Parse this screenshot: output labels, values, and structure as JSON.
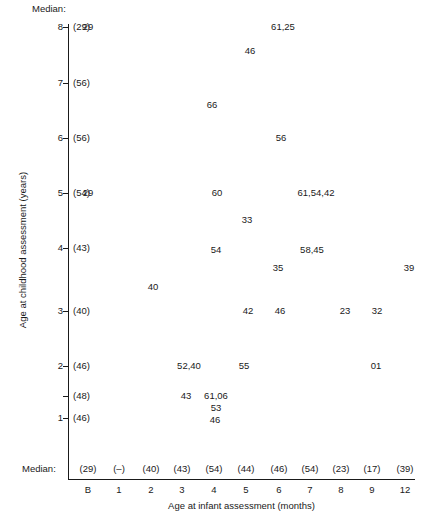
{
  "chart_data": {
    "type": "scatter",
    "title": "",
    "xlabel": "Age at infant assessment (months)",
    "ylabel": "Age at childhood assessment (years)",
    "grid": false,
    "legend": null,
    "notation": "Each plotted entry is a text label listing subject value(s) at that (infant age, childhood age) coordinate; comma-separated when several overlap.",
    "x_categories": [
      "B",
      "1",
      "2",
      "3",
      "4",
      "5",
      "6",
      "7",
      "8",
      "9",
      "12"
    ],
    "x_positions_px": [
      88,
      119,
      151,
      182,
      214,
      246,
      279,
      310,
      341,
      372,
      405
    ],
    "y_ticks": [
      8,
      7,
      6,
      5,
      4,
      3,
      2,
      1
    ],
    "y_tick_positions_px": [
      27,
      83,
      138,
      193,
      248,
      311,
      366,
      418
    ],
    "y_extra_tick_label": "",
    "y_extra_tick_position_px": 396,
    "ylim": [
      0.6,
      8.4
    ],
    "median_row_header": "Median:",
    "y_medians": [
      {
        "y": 8,
        "label": "(29)"
      },
      {
        "y": 7,
        "label": "(56)"
      },
      {
        "y": 6,
        "label": "(56)"
      },
      {
        "y": 5,
        "label": "(54)"
      },
      {
        "y": 4,
        "label": "(43)"
      },
      {
        "y": 3,
        "label": "(40)"
      },
      {
        "y": 2,
        "label": "(46)"
      },
      {
        "y": 1.5,
        "label": "(48)"
      },
      {
        "y": 1,
        "label": "(46)"
      }
    ],
    "x_medians": [
      {
        "x": "B",
        "label": "(29)"
      },
      {
        "x": "1",
        "label": "(–)"
      },
      {
        "x": "2",
        "label": "(40)"
      },
      {
        "x": "3",
        "label": "(43)"
      },
      {
        "x": "4",
        "label": "(54)"
      },
      {
        "x": "5",
        "label": "(44)"
      },
      {
        "x": "6",
        "label": "(46)"
      },
      {
        "x": "7",
        "label": "(54)"
      },
      {
        "x": "8",
        "label": "(23)"
      },
      {
        "x": "9",
        "label": "(17)"
      },
      {
        "x": "12",
        "label": "(39)"
      }
    ],
    "points": [
      {
        "label": "29",
        "x": "B",
        "y": 8,
        "left_px": 88,
        "top_px": 27
      },
      {
        "label": "61,25",
        "x": "6",
        "y": 8,
        "left_px": 283,
        "top_px": 27
      },
      {
        "label": "46",
        "x": "5",
        "y": 7.7,
        "left_px": 250,
        "top_px": 51
      },
      {
        "label": "66",
        "x": "3",
        "y": 6.6,
        "left_px": 212,
        "top_px": 105
      },
      {
        "label": "56",
        "x": "6",
        "y": 6,
        "left_px": 281,
        "top_px": 138
      },
      {
        "label": "29",
        "x": "B",
        "y": 5,
        "left_px": 88,
        "top_px": 193
      },
      {
        "label": "60",
        "x": "4",
        "y": 5,
        "left_px": 217,
        "top_px": 193
      },
      {
        "label": "61,54,42",
        "x": "7",
        "y": 5,
        "left_px": 316,
        "top_px": 193
      },
      {
        "label": "33",
        "x": "5",
        "y": 4.65,
        "left_px": 247,
        "top_px": 220
      },
      {
        "label": "54",
        "x": "4",
        "y": 4,
        "left_px": 216,
        "top_px": 250
      },
      {
        "label": "58,45",
        "x": "7",
        "y": 4,
        "left_px": 312,
        "top_px": 250
      },
      {
        "label": "35",
        "x": "6",
        "y": 3.8,
        "left_px": 278,
        "top_px": 268
      },
      {
        "label": "39",
        "x": "12",
        "y": 3.8,
        "left_px": 409,
        "top_px": 268
      },
      {
        "label": "40",
        "x": "2",
        "y": 3.5,
        "left_px": 153,
        "top_px": 287
      },
      {
        "label": "42",
        "x": "5",
        "y": 3,
        "left_px": 248,
        "top_px": 311
      },
      {
        "label": "46",
        "x": "6",
        "y": 3,
        "left_px": 280,
        "top_px": 311
      },
      {
        "label": "23",
        "x": "8",
        "y": 3,
        "left_px": 345,
        "top_px": 311
      },
      {
        "label": "32",
        "x": "9",
        "y": 3,
        "left_px": 377,
        "top_px": 311
      },
      {
        "label": "52,40",
        "x": "3",
        "y": 2,
        "left_px": 189,
        "top_px": 366
      },
      {
        "label": "55",
        "x": "5",
        "y": 2,
        "left_px": 244,
        "top_px": 366
      },
      {
        "label": "01",
        "x": "9",
        "y": 2,
        "left_px": 376,
        "top_px": 366
      },
      {
        "label": "43",
        "x": "3",
        "y": 1.5,
        "left_px": 186,
        "top_px": 396
      },
      {
        "label": "61,06",
        "x": "4",
        "y": 1.5,
        "left_px": 216,
        "top_px": 396
      },
      {
        "label": "53",
        "x": "4",
        "y": 1.25,
        "left_px": 216,
        "top_px": 408
      },
      {
        "label": "46",
        "x": "4",
        "y": 1,
        "left_px": 215,
        "top_px": 420
      }
    ]
  }
}
